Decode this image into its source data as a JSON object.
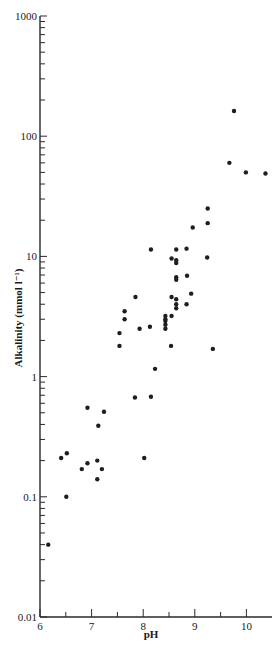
{
  "chart_data": {
    "type": "scatter",
    "title": "",
    "xlabel": "pH",
    "ylabel": "Alkalinity (mmol l⁻¹)",
    "xscale": "linear",
    "yscale": "log",
    "xlim": [
      6,
      10.5
    ],
    "ylim": [
      0.01,
      1000
    ],
    "xticks": [
      6,
      7,
      8,
      9,
      10
    ],
    "xtick_labels": [
      "6",
      "7",
      "8",
      "9",
      "10"
    ],
    "yticks": [
      0.01,
      0.1,
      1,
      10,
      100,
      1000
    ],
    "ytick_labels": [
      "0.01",
      "0.1",
      "1",
      "10",
      "100",
      "1000"
    ],
    "grid": false,
    "legend": null,
    "marker_color": "#1e1e1e",
    "series": [
      {
        "name": "samples",
        "points": [
          [
            6.16,
            0.04
          ],
          [
            6.51,
            0.1
          ],
          [
            6.41,
            0.21
          ],
          [
            6.52,
            0.23
          ],
          [
            6.81,
            0.17
          ],
          [
            6.92,
            0.19
          ],
          [
            7.11,
            0.2
          ],
          [
            7.2,
            0.17
          ],
          [
            7.11,
            0.14
          ],
          [
            6.92,
            0.55
          ],
          [
            7.24,
            0.51
          ],
          [
            7.13,
            0.39
          ],
          [
            7.84,
            0.67
          ],
          [
            8.15,
            0.68
          ],
          [
            8.02,
            0.21
          ],
          [
            7.54,
            2.3
          ],
          [
            7.54,
            1.8
          ],
          [
            7.64,
            3.5
          ],
          [
            7.64,
            3.0
          ],
          [
            7.93,
            2.5
          ],
          [
            8.13,
            2.6
          ],
          [
            7.85,
            4.6
          ],
          [
            8.23,
            1.16
          ],
          [
            8.43,
            3.2
          ],
          [
            8.43,
            3.0
          ],
          [
            8.43,
            2.9
          ],
          [
            8.43,
            2.7
          ],
          [
            8.43,
            2.5
          ],
          [
            8.55,
            3.2
          ],
          [
            8.54,
            1.8
          ],
          [
            9.35,
            1.7
          ],
          [
            8.55,
            4.6
          ],
          [
            8.64,
            4.4
          ],
          [
            8.84,
            4.0
          ],
          [
            8.64,
            4.0
          ],
          [
            8.64,
            3.7
          ],
          [
            8.93,
            4.9
          ],
          [
            8.64,
            6.7
          ],
          [
            8.64,
            6.4
          ],
          [
            8.85,
            6.9
          ],
          [
            8.55,
            9.6
          ],
          [
            8.64,
            9.3
          ],
          [
            8.64,
            8.8
          ],
          [
            9.24,
            9.8
          ],
          [
            8.15,
            11.4
          ],
          [
            8.64,
            11.4
          ],
          [
            8.84,
            11.6
          ],
          [
            8.96,
            17.4
          ],
          [
            9.25,
            18.9
          ],
          [
            9.25,
            25
          ],
          [
            9.67,
            60
          ],
          [
            9.99,
            50
          ],
          [
            10.37,
            49
          ],
          [
            9.76,
            162
          ]
        ]
      }
    ]
  }
}
